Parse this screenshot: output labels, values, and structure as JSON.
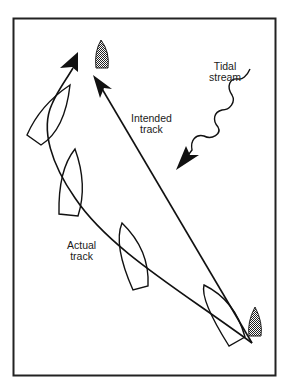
{
  "diagram": {
    "type": "navigation-tidal-drift",
    "labels": {
      "tidal_stream": [
        "Tidal",
        "stream"
      ],
      "intended_track": [
        "Intended",
        "track"
      ],
      "actual_track": [
        "Actual",
        "track"
      ]
    },
    "elements": {
      "start_marker": "shaded-boat (start, bottom-right)",
      "target_marker": "shaded-boat (destination, top)",
      "boat_outlines": 4,
      "arrows": [
        "intended track (straight)",
        "actual track (curved)",
        "tidal stream (wavy)"
      ]
    },
    "colors": {
      "stroke": "#111111",
      "background": "#ffffff",
      "marker_fill": "#555555"
    }
  }
}
